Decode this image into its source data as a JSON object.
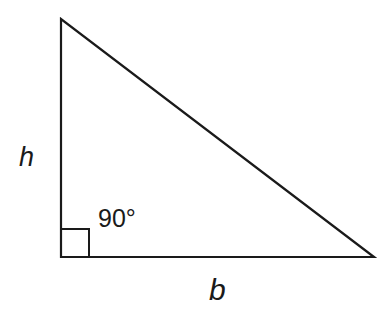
{
  "diagram": {
    "type": "right-triangle",
    "stroke_color": "#1a1a1a",
    "background": "#ffffff",
    "vertices": {
      "top": [
        61,
        19
      ],
      "right_angle": [
        61,
        257
      ],
      "bottom_right": [
        374,
        257
      ]
    },
    "right_angle_marker": {
      "x": 61,
      "y": 229,
      "size": 28
    },
    "labels": {
      "height": "h",
      "base": "b",
      "angle": "90°"
    }
  }
}
